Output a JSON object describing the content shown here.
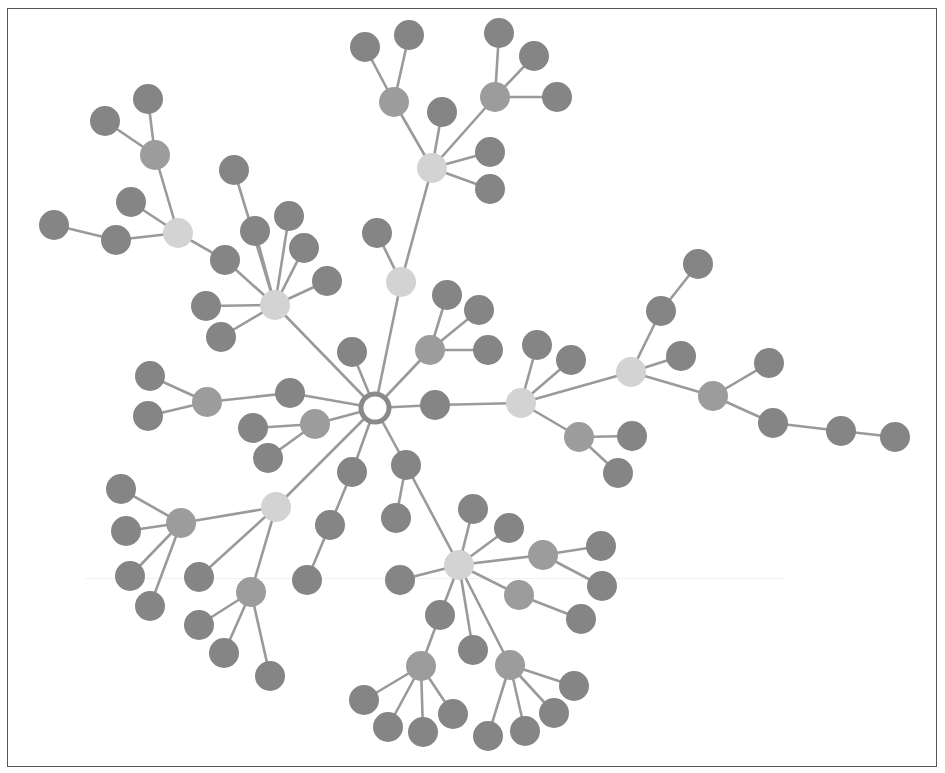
{
  "diagram": {
    "type": "tree-network",
    "root": "n0",
    "colors": {
      "root_fill": "#ffffff",
      "root_stroke": "#8a8a8a",
      "hub": "#d3d3d3",
      "mid": "#9c9c9c",
      "leaf": "#858585",
      "edge": "#9a9a9a",
      "border": "#555555"
    },
    "radius": {
      "root": 14,
      "hub": 15,
      "mid": 15,
      "leaf": 15
    },
    "nodes": [
      {
        "id": "n0",
        "x": 375,
        "y": 408,
        "kind": "root"
      },
      {
        "id": "h1",
        "x": 432,
        "y": 168,
        "kind": "hub"
      },
      {
        "id": "h2",
        "x": 178,
        "y": 233,
        "kind": "hub"
      },
      {
        "id": "h3",
        "x": 275,
        "y": 305,
        "kind": "hub"
      },
      {
        "id": "h4",
        "x": 401,
        "y": 282,
        "kind": "hub"
      },
      {
        "id": "h5",
        "x": 521,
        "y": 403,
        "kind": "hub"
      },
      {
        "id": "h6",
        "x": 631,
        "y": 372,
        "kind": "hub"
      },
      {
        "id": "h7",
        "x": 276,
        "y": 507,
        "kind": "hub"
      },
      {
        "id": "h8",
        "x": 459,
        "y": 565,
        "kind": "hub"
      },
      {
        "id": "m1",
        "x": 394,
        "y": 102,
        "kind": "mid"
      },
      {
        "id": "m2",
        "x": 495,
        "y": 97,
        "kind": "mid"
      },
      {
        "id": "m3",
        "x": 155,
        "y": 155,
        "kind": "mid"
      },
      {
        "id": "m4",
        "x": 430,
        "y": 350,
        "kind": "mid"
      },
      {
        "id": "m5",
        "x": 207,
        "y": 402,
        "kind": "mid"
      },
      {
        "id": "m6",
        "x": 315,
        "y": 424,
        "kind": "mid"
      },
      {
        "id": "m7",
        "x": 579,
        "y": 437,
        "kind": "mid"
      },
      {
        "id": "m8",
        "x": 713,
        "y": 396,
        "kind": "mid"
      },
      {
        "id": "m9",
        "x": 181,
        "y": 523,
        "kind": "mid"
      },
      {
        "id": "m10",
        "x": 251,
        "y": 592,
        "kind": "mid"
      },
      {
        "id": "m11",
        "x": 543,
        "y": 555,
        "kind": "mid"
      },
      {
        "id": "m12",
        "x": 519,
        "y": 595,
        "kind": "mid"
      },
      {
        "id": "m13",
        "x": 421,
        "y": 666,
        "kind": "mid"
      },
      {
        "id": "m14",
        "x": 510,
        "y": 665,
        "kind": "mid"
      },
      {
        "id": "l1",
        "x": 365,
        "y": 47,
        "kind": "leaf"
      },
      {
        "id": "l2",
        "x": 409,
        "y": 35,
        "kind": "leaf"
      },
      {
        "id": "l3",
        "x": 499,
        "y": 33,
        "kind": "leaf"
      },
      {
        "id": "l4",
        "x": 534,
        "y": 56,
        "kind": "leaf"
      },
      {
        "id": "l5",
        "x": 557,
        "y": 97,
        "kind": "leaf"
      },
      {
        "id": "l6",
        "x": 442,
        "y": 112,
        "kind": "leaf"
      },
      {
        "id": "l7",
        "x": 490,
        "y": 152,
        "kind": "leaf"
      },
      {
        "id": "l8",
        "x": 490,
        "y": 189,
        "kind": "leaf"
      },
      {
        "id": "l9",
        "x": 148,
        "y": 99,
        "kind": "leaf"
      },
      {
        "id": "l10",
        "x": 105,
        "y": 121,
        "kind": "leaf"
      },
      {
        "id": "l11",
        "x": 131,
        "y": 202,
        "kind": "leaf"
      },
      {
        "id": "l12",
        "x": 54,
        "y": 225,
        "kind": "leaf"
      },
      {
        "id": "l13",
        "x": 116,
        "y": 240,
        "kind": "leaf"
      },
      {
        "id": "l14",
        "x": 234,
        "y": 170,
        "kind": "leaf"
      },
      {
        "id": "l15",
        "x": 255,
        "y": 231,
        "kind": "leaf"
      },
      {
        "id": "l16",
        "x": 289,
        "y": 216,
        "kind": "leaf"
      },
      {
        "id": "l17",
        "x": 304,
        "y": 248,
        "kind": "leaf"
      },
      {
        "id": "l18",
        "x": 327,
        "y": 281,
        "kind": "leaf"
      },
      {
        "id": "l19",
        "x": 225,
        "y": 260,
        "kind": "leaf"
      },
      {
        "id": "l20",
        "x": 206,
        "y": 306,
        "kind": "leaf"
      },
      {
        "id": "l21",
        "x": 221,
        "y": 337,
        "kind": "leaf"
      },
      {
        "id": "l22",
        "x": 377,
        "y": 233,
        "kind": "leaf"
      },
      {
        "id": "l23",
        "x": 447,
        "y": 295,
        "kind": "leaf"
      },
      {
        "id": "l24",
        "x": 479,
        "y": 310,
        "kind": "leaf"
      },
      {
        "id": "l25",
        "x": 488,
        "y": 350,
        "kind": "leaf"
      },
      {
        "id": "l26",
        "x": 352,
        "y": 352,
        "kind": "leaf"
      },
      {
        "id": "l27",
        "x": 150,
        "y": 376,
        "kind": "leaf"
      },
      {
        "id": "l28",
        "x": 148,
        "y": 416,
        "kind": "leaf"
      },
      {
        "id": "l29",
        "x": 290,
        "y": 393,
        "kind": "leaf"
      },
      {
        "id": "l30",
        "x": 253,
        "y": 428,
        "kind": "leaf"
      },
      {
        "id": "l31",
        "x": 268,
        "y": 458,
        "kind": "leaf"
      },
      {
        "id": "l32",
        "x": 435,
        "y": 405,
        "kind": "leaf"
      },
      {
        "id": "l33",
        "x": 537,
        "y": 345,
        "kind": "leaf"
      },
      {
        "id": "l34",
        "x": 571,
        "y": 360,
        "kind": "leaf"
      },
      {
        "id": "l35",
        "x": 632,
        "y": 436,
        "kind": "leaf"
      },
      {
        "id": "l36",
        "x": 618,
        "y": 473,
        "kind": "leaf"
      },
      {
        "id": "l37",
        "x": 698,
        "y": 264,
        "kind": "leaf"
      },
      {
        "id": "l38",
        "x": 661,
        "y": 311,
        "kind": "leaf"
      },
      {
        "id": "l39",
        "x": 681,
        "y": 356,
        "kind": "leaf"
      },
      {
        "id": "l40",
        "x": 769,
        "y": 363,
        "kind": "leaf"
      },
      {
        "id": "l41",
        "x": 773,
        "y": 423,
        "kind": "leaf"
      },
      {
        "id": "l42",
        "x": 841,
        "y": 431,
        "kind": "leaf"
      },
      {
        "id": "l43",
        "x": 895,
        "y": 437,
        "kind": "leaf"
      },
      {
        "id": "l44",
        "x": 121,
        "y": 489,
        "kind": "leaf"
      },
      {
        "id": "l45",
        "x": 126,
        "y": 531,
        "kind": "leaf"
      },
      {
        "id": "l46",
        "x": 130,
        "y": 576,
        "kind": "leaf"
      },
      {
        "id": "l47",
        "x": 150,
        "y": 606,
        "kind": "leaf"
      },
      {
        "id": "l48",
        "x": 199,
        "y": 577,
        "kind": "leaf"
      },
      {
        "id": "l49",
        "x": 199,
        "y": 625,
        "kind": "leaf"
      },
      {
        "id": "l50",
        "x": 224,
        "y": 653,
        "kind": "leaf"
      },
      {
        "id": "l51",
        "x": 270,
        "y": 676,
        "kind": "leaf"
      },
      {
        "id": "l52",
        "x": 352,
        "y": 472,
        "kind": "leaf"
      },
      {
        "id": "l53",
        "x": 330,
        "y": 525,
        "kind": "leaf"
      },
      {
        "id": "l54",
        "x": 307,
        "y": 580,
        "kind": "leaf"
      },
      {
        "id": "l55",
        "x": 406,
        "y": 465,
        "kind": "leaf"
      },
      {
        "id": "l56",
        "x": 396,
        "y": 518,
        "kind": "leaf"
      },
      {
        "id": "l57",
        "x": 400,
        "y": 580,
        "kind": "leaf"
      },
      {
        "id": "l58",
        "x": 473,
        "y": 509,
        "kind": "leaf"
      },
      {
        "id": "l59",
        "x": 509,
        "y": 528,
        "kind": "leaf"
      },
      {
        "id": "l60",
        "x": 601,
        "y": 546,
        "kind": "leaf"
      },
      {
        "id": "l61",
        "x": 602,
        "y": 586,
        "kind": "leaf"
      },
      {
        "id": "l62",
        "x": 581,
        "y": 619,
        "kind": "leaf"
      },
      {
        "id": "l63",
        "x": 440,
        "y": 615,
        "kind": "leaf"
      },
      {
        "id": "l64",
        "x": 473,
        "y": 650,
        "kind": "leaf"
      },
      {
        "id": "l65",
        "x": 364,
        "y": 700,
        "kind": "leaf"
      },
      {
        "id": "l66",
        "x": 388,
        "y": 727,
        "kind": "leaf"
      },
      {
        "id": "l67",
        "x": 423,
        "y": 732,
        "kind": "leaf"
      },
      {
        "id": "l68",
        "x": 453,
        "y": 714,
        "kind": "leaf"
      },
      {
        "id": "l69",
        "x": 488,
        "y": 736,
        "kind": "leaf"
      },
      {
        "id": "l70",
        "x": 525,
        "y": 731,
        "kind": "leaf"
      },
      {
        "id": "l71",
        "x": 554,
        "y": 713,
        "kind": "leaf"
      },
      {
        "id": "l72",
        "x": 574,
        "y": 686,
        "kind": "leaf"
      }
    ],
    "edges": [
      [
        "n0",
        "h4"
      ],
      [
        "h4",
        "h1"
      ],
      [
        "h4",
        "l22"
      ],
      [
        "h1",
        "m1"
      ],
      [
        "h1",
        "m2"
      ],
      [
        "h1",
        "l6"
      ],
      [
        "h1",
        "l7"
      ],
      [
        "h1",
        "l8"
      ],
      [
        "m1",
        "l1"
      ],
      [
        "m1",
        "l2"
      ],
      [
        "m2",
        "l3"
      ],
      [
        "m2",
        "l4"
      ],
      [
        "m2",
        "l5"
      ],
      [
        "n0",
        "h3"
      ],
      [
        "h3",
        "l19"
      ],
      [
        "l19",
        "h2"
      ],
      [
        "h2",
        "m3"
      ],
      [
        "h2",
        "l11"
      ],
      [
        "h2",
        "l13"
      ],
      [
        "l13",
        "l12"
      ],
      [
        "m3",
        "l9"
      ],
      [
        "m3",
        "l10"
      ],
      [
        "h3",
        "l14"
      ],
      [
        "h3",
        "l15"
      ],
      [
        "h3",
        "l16"
      ],
      [
        "h3",
        "l17"
      ],
      [
        "h3",
        "l18"
      ],
      [
        "h3",
        "l20"
      ],
      [
        "h3",
        "l21"
      ],
      [
        "n0",
        "m4"
      ],
      [
        "m4",
        "l23"
      ],
      [
        "m4",
        "l24"
      ],
      [
        "m4",
        "l25"
      ],
      [
        "n0",
        "l26"
      ],
      [
        "n0",
        "l29"
      ],
      [
        "l29",
        "m5"
      ],
      [
        "m5",
        "l27"
      ],
      [
        "m5",
        "l28"
      ],
      [
        "n0",
        "m6"
      ],
      [
        "m6",
        "l30"
      ],
      [
        "m6",
        "l31"
      ],
      [
        "n0",
        "l32"
      ],
      [
        "l32",
        "h5"
      ],
      [
        "h5",
        "l33"
      ],
      [
        "h5",
        "l34"
      ],
      [
        "h5",
        "m7"
      ],
      [
        "m7",
        "l35"
      ],
      [
        "m7",
        "l36"
      ],
      [
        "h5",
        "h6"
      ],
      [
        "h6",
        "l38"
      ],
      [
        "l38",
        "l37"
      ],
      [
        "h6",
        "l39"
      ],
      [
        "h6",
        "m8"
      ],
      [
        "m8",
        "l40"
      ],
      [
        "m8",
        "l41"
      ],
      [
        "l41",
        "l42"
      ],
      [
        "l42",
        "l43"
      ],
      [
        "n0",
        "h7"
      ],
      [
        "h7",
        "m9"
      ],
      [
        "m9",
        "l44"
      ],
      [
        "m9",
        "l45"
      ],
      [
        "m9",
        "l46"
      ],
      [
        "m9",
        "l47"
      ],
      [
        "h7",
        "l48"
      ],
      [
        "h7",
        "m10"
      ],
      [
        "m10",
        "l49"
      ],
      [
        "m10",
        "l50"
      ],
      [
        "m10",
        "l51"
      ],
      [
        "n0",
        "l52"
      ],
      [
        "l52",
        "l53"
      ],
      [
        "l53",
        "l54"
      ],
      [
        "n0",
        "l55"
      ],
      [
        "l55",
        "l56"
      ],
      [
        "l55",
        "h8"
      ],
      [
        "h8",
        "l57"
      ],
      [
        "h8",
        "l58"
      ],
      [
        "h8",
        "l59"
      ],
      [
        "h8",
        "m11"
      ],
      [
        "m11",
        "l60"
      ],
      [
        "m11",
        "l61"
      ],
      [
        "h8",
        "m12"
      ],
      [
        "m12",
        "l62"
      ],
      [
        "h8",
        "l63"
      ],
      [
        "l63",
        "m13"
      ],
      [
        "m13",
        "l65"
      ],
      [
        "m13",
        "l66"
      ],
      [
        "m13",
        "l67"
      ],
      [
        "m13",
        "l68"
      ],
      [
        "h8",
        "l64"
      ],
      [
        "h8",
        "m14"
      ],
      [
        "m14",
        "l69"
      ],
      [
        "m14",
        "l70"
      ],
      [
        "m14",
        "l71"
      ],
      [
        "m14",
        "l72"
      ]
    ]
  }
}
